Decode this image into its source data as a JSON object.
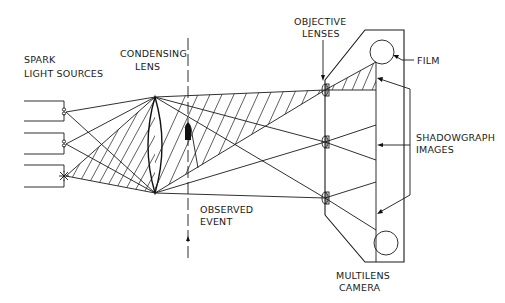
{
  "labels": {
    "spark_line1": "SPARK",
    "spark_line2": "LIGHT SOURCES",
    "condensing_line1": "CONDENSING",
    "condensing_line2": "LENS",
    "objective_line1": "OBJECTIVE",
    "objective_line2": "LENSES",
    "film": "FILM",
    "shadow_line1": "SHADOWGRAPH",
    "shadow_line2": "IMAGES",
    "observed_line1": "OBSERVED",
    "observed_line2": "EVENT",
    "camera_line1": "MULTILENS",
    "camera_line2": "CAMERA"
  },
  "components": {
    "light_sources": [
      "spark gap 1",
      "spark gap 2",
      "spark (firing)"
    ],
    "objective_lens_count": 3,
    "film_rolls": 2
  },
  "colors": {
    "ink": "#1a1a1a",
    "background": "#ffffff"
  }
}
